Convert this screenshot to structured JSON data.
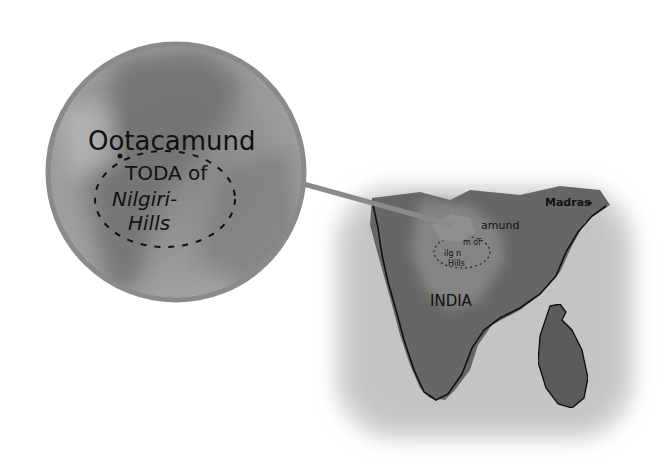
{
  "map": {
    "inset": {
      "city_label": "Ootacamund",
      "region_line1": "TODA of",
      "region_line2": "Nilgiri-",
      "region_line3": "Hills"
    },
    "main": {
      "country_label": "INDIA",
      "city_label_partial": "amund",
      "region_partial1": "m of",
      "region_partial2": "ilg n",
      "region_partial3": "Hills",
      "madras_label": "Madras"
    },
    "colors": {
      "magnifier_ring": "#8a8a8a",
      "land_dark": "#5a5a5a",
      "sea_light": "#cfcfcf",
      "coastline": "#111111"
    }
  }
}
